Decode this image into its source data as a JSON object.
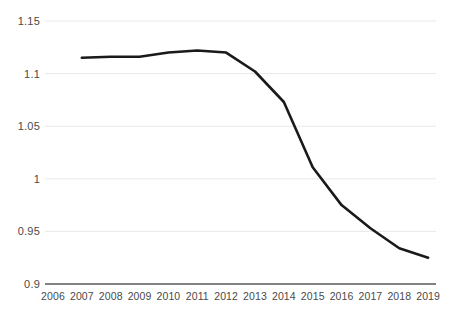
{
  "chart_data": {
    "type": "line",
    "title": "",
    "subtitle": "",
    "xlabel": "",
    "ylabel": "",
    "categories": [
      "2006",
      "2007",
      "2008",
      "2009",
      "2010",
      "2011",
      "2012",
      "2013",
      "2014",
      "2015",
      "2016",
      "2017",
      "2018",
      "2019"
    ],
    "x_tick_labels": [
      "2006",
      "2007",
      "2008",
      "2009",
      "2010",
      "2011",
      "2012",
      "2013",
      "2014",
      "2015",
      "2016",
      "2017",
      "2018",
      "2019"
    ],
    "y_tick_labels": [
      "1.15",
      "1.1",
      "1.05",
      "1",
      "0.95",
      "0.9"
    ],
    "y_tick_values": [
      1.15,
      1.1,
      1.05,
      1,
      0.95,
      0.9
    ],
    "ylim": [
      0.9,
      1.15
    ],
    "xlim": [
      "2006",
      "2019"
    ],
    "grid": true,
    "grid_axis": "y",
    "legend": false,
    "legend_position": "none",
    "series": [
      {
        "name": "",
        "color": "#1a1a1a",
        "line_width": 2.6,
        "markers": false,
        "x": [
          "2007",
          "2008",
          "2009",
          "2010",
          "2011",
          "2012",
          "2013",
          "2014",
          "2015",
          "2016",
          "2017",
          "2018",
          "2019"
        ],
        "values": [
          1.115,
          1.116,
          1.116,
          1.12,
          1.122,
          1.12,
          1.102,
          1.073,
          1.011,
          0.975,
          0.953,
          0.934,
          0.925
        ]
      }
    ],
    "annotations": [],
    "colors": {
      "line": "#1a1a1a",
      "gridline": "#e8e8e8",
      "axis": "#595959",
      "tick_label": "#4a4a4a",
      "background": "#ffffff"
    }
  }
}
